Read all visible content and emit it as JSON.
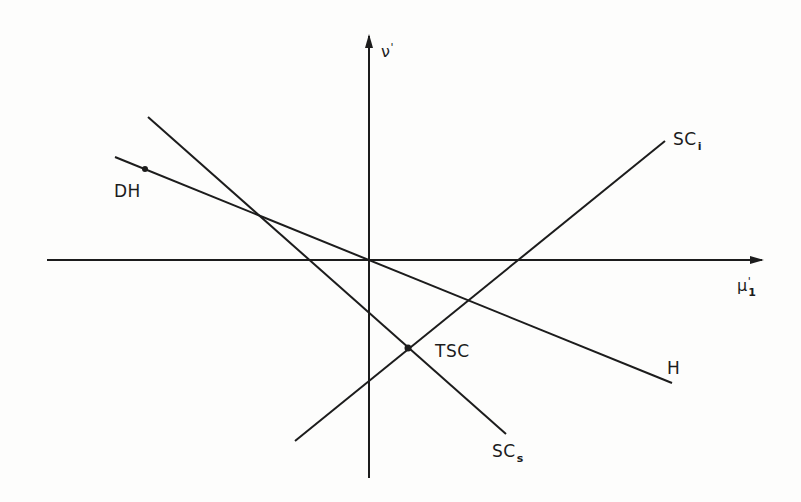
{
  "diagram": {
    "type": "line-intersection-diagram",
    "colors": {
      "ink": "#1c1c1c",
      "background": "#fdfdfc"
    },
    "axes": {
      "x": {
        "label_base": "μ",
        "label_sup": "'",
        "label_sub": "1"
      },
      "y": {
        "label_base": "ν",
        "label_sup": "'"
      }
    },
    "lines": [
      {
        "id": "H",
        "label": "H",
        "start_label": "DH"
      },
      {
        "id": "SCs",
        "label_base": "SC",
        "label_sub": "s"
      },
      {
        "id": "SCi",
        "label_base": "SC",
        "label_sub": "i"
      }
    ],
    "points": [
      {
        "id": "TSC",
        "label": "TSC"
      }
    ]
  }
}
